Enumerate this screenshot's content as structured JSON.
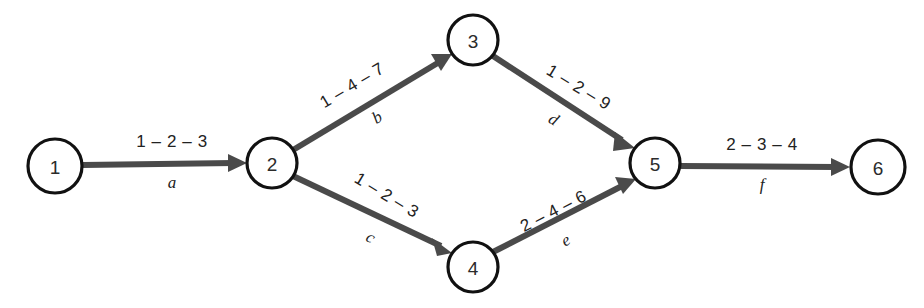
{
  "diagram": {
    "type": "directed-network",
    "background_color": "#ffffff",
    "node_stroke_color": "#111111",
    "node_fill_color": "#ffffff",
    "edge_color": "#4a4a4a",
    "text_color": "#222222"
  },
  "nodes": [
    {
      "id": "1",
      "label": "1",
      "cx": 55,
      "cy": 166,
      "r": 27
    },
    {
      "id": "2",
      "label": "2",
      "cx": 272,
      "cy": 163,
      "r": 25
    },
    {
      "id": "3",
      "label": "3",
      "cx": 473,
      "cy": 40,
      "r": 25
    },
    {
      "id": "4",
      "label": "4",
      "cx": 473,
      "cy": 267,
      "r": 25
    },
    {
      "id": "5",
      "label": "5",
      "cx": 655,
      "cy": 163,
      "r": 25
    },
    {
      "id": "6",
      "label": "6",
      "cx": 878,
      "cy": 167,
      "r": 27
    }
  ],
  "edges": [
    {
      "id": "a",
      "name": "a",
      "from": "1",
      "to": "2",
      "times": "1 – 2 – 3",
      "optimistic": 1,
      "most_likely": 2,
      "pessimistic": 3,
      "times_x": 172,
      "times_y": 147,
      "name_x": 172,
      "name_y": 188,
      "rotation": 0
    },
    {
      "id": "b",
      "name": "b",
      "from": "2",
      "to": "3",
      "times": "1 – 4 – 7",
      "optimistic": 1,
      "most_likely": 4,
      "pessimistic": 7,
      "times_x": 355,
      "times_y": 90,
      "name_x": 380,
      "name_y": 122,
      "rotation": -31
    },
    {
      "id": "c",
      "name": "c",
      "from": "2",
      "to": "4",
      "times": "1 – 2 – 3",
      "optimistic": 1,
      "most_likely": 2,
      "pessimistic": 3,
      "times_x": 384,
      "typo": "",
      "times_y": 200,
      "name_x": 368,
      "name_y": 242,
      "rotation": 31
    },
    {
      "id": "d",
      "name": "d",
      "from": "3",
      "to": "5",
      "times": "1 – 2 – 9",
      "optimistic": 1,
      "most_likely": 2,
      "pessimistic": 9,
      "times_x": 576,
      "times_y": 92,
      "name_x": 551,
      "name_y": 124,
      "rotation": 31
    },
    {
      "id": "e",
      "name": "e",
      "from": "4",
      "to": "5",
      "times": "2 – 4 – 6",
      "optimistic": 2,
      "most_likely": 4,
      "pessimistic": 6,
      "times_x": 556,
      "times_y": 216,
      "name_x": 568,
      "name_y": 245,
      "rotation": -31
    },
    {
      "id": "f",
      "name": "f",
      "from": "5",
      "to": "6",
      "times": "2 – 3 – 4",
      "optimistic": 2,
      "most_likely": 3,
      "pessimistic": 4,
      "times_x": 762,
      "times_y": 150,
      "name_x": 762,
      "name_y": 190,
      "rotation": 0
    }
  ]
}
